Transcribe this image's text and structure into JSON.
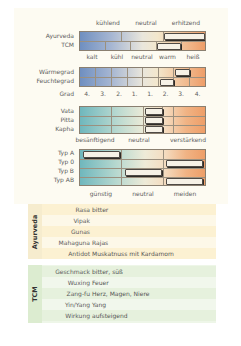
{
  "section_thermal": {
    "top_labels": [
      "kühlend",
      "neutral",
      "erhitzend"
    ],
    "rows": [
      "Ayurveda",
      "TCM"
    ],
    "bottom_labels": [
      "kalt",
      "kühl",
      "neutral",
      "warm",
      "heiß"
    ],
    "ayurveda_marker": "erhitzend",
    "tcm_marker": "warm"
  },
  "section_grade": {
    "rows": [
      "Wärmegrad",
      "Feuchtegrad"
    ],
    "axis_label": "Grad",
    "ticks": [
      "4.",
      "3.",
      "2.",
      "1.",
      "1.",
      "2.",
      "3.",
      "4."
    ],
    "waermegrad_marker": "3. (warm)",
    "feuchtegrad_marker": "2. (warm)"
  },
  "section_dosha": {
    "rows": [
      "Vata",
      "Pitta",
      "Kapha"
    ],
    "bottom_labels": [
      "besänftigend",
      "neutral",
      "verstärkend"
    ],
    "markers": [
      "neutral",
      "neutral",
      "neutral"
    ]
  },
  "section_blood": {
    "rows": [
      "Typ A",
      "Typ 0",
      "Typ B",
      "Typ AB"
    ],
    "bottom_labels": [
      "günstig",
      "neutral",
      "meiden"
    ],
    "markers": [
      "günstig",
      "meiden",
      "neutral",
      "meiden"
    ]
  },
  "ayurveda_table": {
    "title": "Ayurveda",
    "color": "#fbf0cf",
    "rows": [
      {
        "key": "Rasa",
        "value": "bitter"
      },
      {
        "key": "Vipak",
        "value": ""
      },
      {
        "key": "Gunas",
        "value": ""
      },
      {
        "key": "Mahaguna",
        "value": "Rajas"
      },
      {
        "key": "Antidot",
        "value": "Muskatnuss mit Kardamom"
      }
    ]
  },
  "tcm_table": {
    "title": "TCM",
    "color": "#e3f0d8",
    "rows": [
      {
        "key": "Geschmack",
        "value": "bitter, süß"
      },
      {
        "key": "Wuxing",
        "value": "Feuer"
      },
      {
        "key": "Zang-fu",
        "value": "Herz, Magen, Niere"
      },
      {
        "key": "Yin/Yang",
        "value": "Yang"
      },
      {
        "key": "Wirkung",
        "value": "aufsteigend"
      }
    ]
  }
}
